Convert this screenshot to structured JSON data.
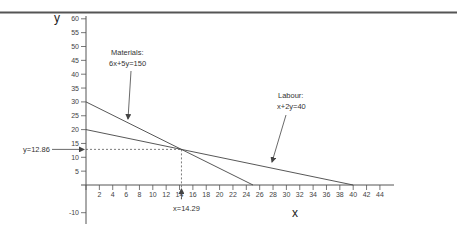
{
  "chart_data": {
    "type": "line",
    "title": "",
    "xlabel": "x",
    "ylabel": "y",
    "xlim": [
      0,
      46
    ],
    "ylim": [
      -14,
      62
    ],
    "grid": false,
    "legend": "none",
    "x_ticks": [
      2,
      4,
      6,
      8,
      10,
      12,
      14,
      16,
      18,
      20,
      22,
      24,
      26,
      28,
      30,
      32,
      34,
      36,
      38,
      40,
      42,
      44
    ],
    "y_ticks": [
      -10,
      5,
      10,
      15,
      20,
      25,
      30,
      35,
      40,
      45,
      50,
      55,
      60
    ],
    "series": [
      {
        "name": "Materials",
        "equation": "6x+5y=150",
        "points": [
          {
            "x": 0,
            "y": 30
          },
          {
            "x": 25,
            "y": 0
          }
        ]
      },
      {
        "name": "Labour",
        "equation": "x+2y=40",
        "points": [
          {
            "x": 0,
            "y": 20
          },
          {
            "x": 40,
            "y": 0
          }
        ]
      }
    ],
    "intersection": {
      "x": 14.29,
      "y": 12.86
    },
    "annotations": [
      {
        "text_line1": "Materials:",
        "text_line2": "6x+5y=150",
        "target_series": "Materials"
      },
      {
        "text_line1": "Labour:",
        "text_line2": "x+2y=40",
        "target_series": "Labour"
      },
      {
        "text": "y=12.86",
        "type": "y-value marker"
      },
      {
        "text": "x=14.29",
        "type": "x-value marker"
      }
    ]
  },
  "labels": {
    "y_axis": "y",
    "x_axis": "x",
    "materials_title": "Materials:",
    "materials_eq": "6x+5y=150",
    "labour_title": "Labour:",
    "labour_eq": "x+2y=40",
    "y_marker": "y=12.86",
    "x_marker": "x=14.29"
  },
  "colors": {
    "axis": "#555555",
    "line": "#444444",
    "border": "#555555",
    "text": "#333333"
  }
}
